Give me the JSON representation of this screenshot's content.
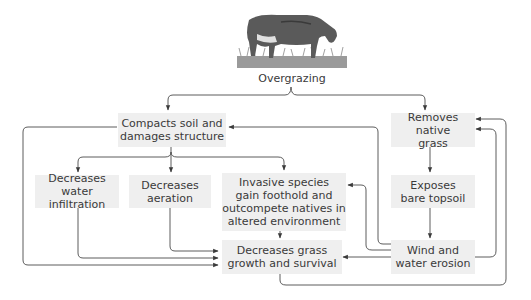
{
  "title": "Overgrazing",
  "image": {
    "semantic": "grazing-cow-illustration"
  },
  "nodes": {
    "compacts": "Compacts soil and damages structure",
    "removes": "Removes native grass",
    "water_infiltration": "Decreases water infiltration",
    "aeration": "Decreases aeration",
    "invasive": "Invasive species gain foothold and outcompete natives in altered environment",
    "exposes": "Exposes bare topsoil",
    "grass_growth": "Decreases grass growth and survival",
    "erosion": "Wind and water erosion"
  },
  "lines": {
    "compacts": [
      "Compacts soil and",
      "damages structure"
    ],
    "removes": [
      "Removes native",
      "grass"
    ],
    "water_infiltration": [
      "Decreases water",
      "infiltration"
    ],
    "aeration": [
      "Decreases",
      "aeration"
    ],
    "invasive": [
      "Invasive species",
      "gain foothold and",
      "outcompete natives in",
      "altered environment"
    ],
    "exposes": [
      "Exposes",
      "bare topsoil"
    ],
    "grass_growth": [
      "Decreases grass",
      "growth and survival"
    ],
    "erosion": [
      "Wind and",
      "water erosion"
    ]
  },
  "edges": [
    [
      "Overgrazing",
      "Compacts soil and damages structure"
    ],
    [
      "Overgrazing",
      "Removes native grass"
    ],
    [
      "Compacts soil and damages structure",
      "Decreases water infiltration"
    ],
    [
      "Compacts soil and damages structure",
      "Decreases aeration"
    ],
    [
      "Compacts soil and damages structure",
      "Invasive species gain foothold and outcompete natives in altered environment"
    ],
    [
      "Compacts soil and damages structure",
      "Decreases grass growth and survival"
    ],
    [
      "Decreases water infiltration",
      "Decreases grass growth and survival"
    ],
    [
      "Decreases aeration",
      "Decreases grass growth and survival"
    ],
    [
      "Invasive species gain foothold and outcompete natives in altered environment",
      "Decreases grass growth and survival"
    ],
    [
      "Removes native grass",
      "Exposes bare topsoil"
    ],
    [
      "Exposes bare topsoil",
      "Wind and water erosion"
    ],
    [
      "Wind and water erosion",
      "Compacts soil and damages structure"
    ],
    [
      "Wind and water erosion",
      "Invasive species gain foothold and outcompete natives in altered environment"
    ],
    [
      "Wind and water erosion",
      "Decreases grass growth and survival"
    ],
    [
      "Wind and water erosion",
      "Removes native grass"
    ],
    [
      "Decreases grass growth and survival",
      "Removes native grass"
    ]
  ],
  "colors": {
    "box": "#efefef",
    "line": "#4a4a4a",
    "text": "#3a3a3a"
  }
}
